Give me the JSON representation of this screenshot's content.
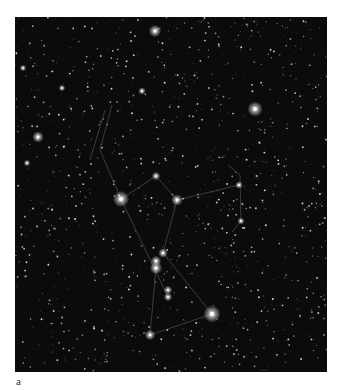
{
  "figure": {
    "label": "a",
    "colors": {
      "sky": "#0b0b0b",
      "star": "#ffffff",
      "lines": "#8a8a8a"
    }
  },
  "bright_stars": [
    {
      "x": 155,
      "y": 31,
      "r": 2.6
    },
    {
      "x": 255,
      "y": 109,
      "r": 3.2
    },
    {
      "x": 38,
      "y": 137,
      "r": 2.4
    },
    {
      "x": 121,
      "y": 199,
      "r": 3.4
    },
    {
      "x": 177,
      "y": 200,
      "r": 2.4
    },
    {
      "x": 156,
      "y": 176,
      "r": 1.8
    },
    {
      "x": 163,
      "y": 253,
      "r": 2.0
    },
    {
      "x": 156,
      "y": 261,
      "r": 2.2
    },
    {
      "x": 156,
      "y": 268,
      "r": 2.6
    },
    {
      "x": 168,
      "y": 290,
      "r": 1.8
    },
    {
      "x": 168,
      "y": 297,
      "r": 1.8
    },
    {
      "x": 212,
      "y": 314,
      "r": 3.6
    },
    {
      "x": 150,
      "y": 335,
      "r": 2.2
    },
    {
      "x": 142,
      "y": 91,
      "r": 1.6
    },
    {
      "x": 62,
      "y": 88,
      "r": 1.4
    },
    {
      "x": 23,
      "y": 68,
      "r": 1.4
    },
    {
      "x": 239,
      "y": 185,
      "r": 1.6
    },
    {
      "x": 241,
      "y": 221,
      "r": 1.5
    },
    {
      "x": 27,
      "y": 163,
      "r": 1.4
    }
  ],
  "lines": [
    [
      [
        121,
        199
      ],
      [
        156,
        176
      ]
    ],
    [
      [
        156,
        176
      ],
      [
        177,
        200
      ]
    ],
    [
      [
        177,
        200
      ],
      [
        239,
        185
      ]
    ],
    [
      [
        121,
        199
      ],
      [
        168,
        297
      ]
    ],
    [
      [
        177,
        200
      ],
      [
        163,
        253
      ]
    ],
    [
      [
        163,
        253
      ],
      [
        212,
        314
      ]
    ],
    [
      [
        212,
        314
      ],
      [
        150,
        335
      ]
    ],
    [
      [
        150,
        335
      ],
      [
        156,
        268
      ]
    ],
    [
      [
        121,
        199
      ],
      [
        100,
        150
      ]
    ],
    [
      [
        100,
        150
      ],
      [
        112,
        105
      ]
    ],
    [
      [
        90,
        160
      ],
      [
        105,
        110
      ]
    ],
    [
      [
        228,
        165
      ],
      [
        240,
        175
      ]
    ],
    [
      [
        240,
        175
      ],
      [
        241,
        221
      ]
    ],
    [
      [
        241,
        221
      ],
      [
        232,
        232
      ]
    ]
  ]
}
